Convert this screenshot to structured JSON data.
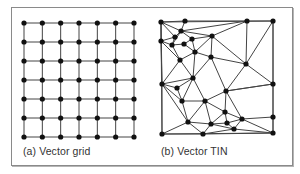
{
  "figure": {
    "panels": [
      {
        "id": "a",
        "caption": "(a) Vector grid",
        "type": "regular-grid",
        "rows": 7,
        "cols": 7,
        "x_start": 24,
        "x_end": 134,
        "y_start": 23,
        "y_end": 137
      },
      {
        "id": "b",
        "caption": "(b) Vector TIN",
        "type": "triangulated-irregular-network",
        "nodes": [
          [
            161,
            22
          ],
          [
            185,
            21
          ],
          [
            247,
            21
          ],
          [
            273,
            21
          ],
          [
            181,
            31
          ],
          [
            175,
            37
          ],
          [
            161,
            41
          ],
          [
            172,
            45
          ],
          [
            184,
            44
          ],
          [
            192,
            39
          ],
          [
            212,
            36
          ],
          [
            195,
            52
          ],
          [
            180,
            60
          ],
          [
            211,
            57
          ],
          [
            246,
            64
          ],
          [
            193,
            78
          ],
          [
            162,
            84
          ],
          [
            177,
            88
          ],
          [
            273,
            84
          ],
          [
            226,
            91
          ],
          [
            182,
            101
          ],
          [
            205,
            101
          ],
          [
            225,
            112
          ],
          [
            188,
            122
          ],
          [
            211,
            124
          ],
          [
            227,
            123
          ],
          [
            242,
            119
          ],
          [
            234,
            129
          ],
          [
            273,
            117
          ],
          [
            162,
            134
          ],
          [
            203,
            134
          ],
          [
            273,
            133
          ]
        ],
        "edges": [
          [
            0,
            1
          ],
          [
            1,
            2
          ],
          [
            2,
            3
          ],
          [
            0,
            4
          ],
          [
            1,
            4
          ],
          [
            4,
            2
          ],
          [
            4,
            10
          ],
          [
            4,
            9
          ],
          [
            4,
            5
          ],
          [
            0,
            5
          ],
          [
            0,
            6
          ],
          [
            5,
            6
          ],
          [
            5,
            7
          ],
          [
            6,
            7
          ],
          [
            4,
            7
          ],
          [
            7,
            8
          ],
          [
            8,
            9
          ],
          [
            9,
            10
          ],
          [
            10,
            2
          ],
          [
            7,
            12
          ],
          [
            6,
            12
          ],
          [
            8,
            11
          ],
          [
            9,
            11
          ],
          [
            11,
            12
          ],
          [
            10,
            11
          ],
          [
            10,
            13
          ],
          [
            10,
            14
          ],
          [
            2,
            14
          ],
          [
            3,
            18
          ],
          [
            14,
            18
          ],
          [
            14,
            3
          ],
          [
            11,
            13
          ],
          [
            12,
            15
          ],
          [
            11,
            15
          ],
          [
            13,
            15
          ],
          [
            6,
            16
          ],
          [
            12,
            16
          ],
          [
            15,
            16
          ],
          [
            16,
            17
          ],
          [
            15,
            17
          ],
          [
            13,
            19
          ],
          [
            14,
            19
          ],
          [
            18,
            19
          ],
          [
            13,
            14
          ],
          [
            17,
            20
          ],
          [
            16,
            20
          ],
          [
            15,
            20
          ],
          [
            20,
            21
          ],
          [
            15,
            21
          ],
          [
            19,
            21
          ],
          [
            19,
            22
          ],
          [
            19,
            18
          ],
          [
            21,
            22
          ],
          [
            21,
            23
          ],
          [
            20,
            23
          ],
          [
            16,
            23
          ],
          [
            16,
            29
          ],
          [
            0,
            16
          ],
          [
            23,
            29
          ],
          [
            23,
            24
          ],
          [
            22,
            24
          ],
          [
            21,
            24
          ],
          [
            22,
            25
          ],
          [
            22,
            26
          ],
          [
            25,
            26
          ],
          [
            19,
            26
          ],
          [
            26,
            28
          ],
          [
            18,
            28
          ],
          [
            25,
            27
          ],
          [
            26,
            27
          ],
          [
            24,
            25
          ],
          [
            23,
            30
          ],
          [
            24,
            30
          ],
          [
            29,
            30
          ],
          [
            30,
            27
          ],
          [
            27,
            31
          ],
          [
            28,
            31
          ],
          [
            30,
            31
          ],
          [
            26,
            31
          ],
          [
            24,
            27
          ]
        ]
      }
    ],
    "colors": {
      "line": "#444444",
      "node": "#111111",
      "frame": "#8a8a8a",
      "caption": "#333333"
    }
  }
}
